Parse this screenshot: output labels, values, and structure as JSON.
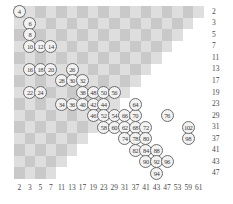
{
  "chart_data": {
    "type": "scatter",
    "title": "",
    "subtitle": "",
    "xlabel": "",
    "ylabel": "",
    "grid": true,
    "legend": "none",
    "xticks": [
      2,
      3,
      5,
      7,
      11,
      13,
      17,
      19,
      23,
      29,
      31,
      37,
      41,
      43,
      47,
      53,
      59,
      61
    ],
    "yticks": [
      2,
      3,
      5,
      7,
      11,
      13,
      17,
      19,
      23,
      29,
      31,
      37,
      41,
      43,
      47
    ],
    "point_label_note": "Each marker is an even number n plotted at (p, q) where p + q = n and p, q are primes with p <= q",
    "points": [
      {
        "x": 2,
        "y": 2,
        "label": "4"
      },
      {
        "x": 3,
        "y": 3,
        "label": "6"
      },
      {
        "x": 3,
        "y": 5,
        "label": "8"
      },
      {
        "x": 3,
        "y": 7,
        "label": "10"
      },
      {
        "x": 5,
        "y": 7,
        "label": "12"
      },
      {
        "x": 7,
        "y": 7,
        "label": "14"
      },
      {
        "x": 3,
        "y": 13,
        "label": "16"
      },
      {
        "x": 5,
        "y": 13,
        "label": "18"
      },
      {
        "x": 7,
        "y": 13,
        "label": "20"
      },
      {
        "x": 3,
        "y": 19,
        "label": "22"
      },
      {
        "x": 5,
        "y": 19,
        "label": "24"
      },
      {
        "x": 13,
        "y": 13,
        "label": "26"
      },
      {
        "x": 11,
        "y": 17,
        "label": "28"
      },
      {
        "x": 13,
        "y": 17,
        "label": "30"
      },
      {
        "x": 17,
        "y": 17,
        "label": "32"
      },
      {
        "x": 11,
        "y": 23,
        "label": "34"
      },
      {
        "x": 13,
        "y": 23,
        "label": "36"
      },
      {
        "x": 17,
        "y": 19,
        "label": "38"
      },
      {
        "x": 17,
        "y": 23,
        "label": "40"
      },
      {
        "x": 19,
        "y": 23,
        "label": "42"
      },
      {
        "x": 19,
        "y": 29,
        "label": "46"
      },
      {
        "x": 23,
        "y": 23,
        "label": "44"
      },
      {
        "x": 23,
        "y": 29,
        "label": "52"
      },
      {
        "x": 29,
        "y": 29,
        "label": "54"
      },
      {
        "x": 19,
        "y": 19,
        "label": "48"
      },
      {
        "x": 23,
        "y": 19,
        "label": "50"
      },
      {
        "x": 29,
        "y": 19,
        "label": "56"
      },
      {
        "x": 23,
        "y": 31,
        "label": "58"
      },
      {
        "x": 29,
        "y": 31,
        "label": "60"
      },
      {
        "x": 31,
        "y": 31,
        "label": "62"
      },
      {
        "x": 37,
        "y": 31,
        "label": "68"
      },
      {
        "x": 41,
        "y": 31,
        "label": "72"
      },
      {
        "x": 31,
        "y": 29,
        "label": "66"
      },
      {
        "x": 37,
        "y": 29,
        "label": "70"
      },
      {
        "x": 37,
        "y": 23,
        "label": "64"
      },
      {
        "x": 31,
        "y": 37,
        "label": "74"
      },
      {
        "x": 37,
        "y": 37,
        "label": "78"
      },
      {
        "x": 41,
        "y": 37,
        "label": "80"
      },
      {
        "x": 37,
        "y": 41,
        "label": "82"
      },
      {
        "x": 41,
        "y": 41,
        "label": "84"
      },
      {
        "x": 43,
        "y": 41,
        "label": "88"
      },
      {
        "x": 41,
        "y": 43,
        "label": "90"
      },
      {
        "x": 43,
        "y": 43,
        "label": "92"
      },
      {
        "x": 47,
        "y": 43,
        "label": "96"
      },
      {
        "x": 43,
        "y": 47,
        "label": "94"
      },
      {
        "x": 47,
        "y": 29,
        "label": "76"
      },
      {
        "x": 59,
        "y": 37,
        "label": "98"
      },
      {
        "x": 59,
        "y": 31,
        "label": "102"
      }
    ]
  }
}
